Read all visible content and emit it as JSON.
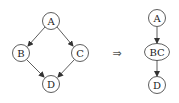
{
  "left_graph": {
    "nodes": [
      {
        "id": "A",
        "label": "A",
        "cx": 51,
        "cy": 21
      },
      {
        "id": "B",
        "label": "B",
        "cx": 21,
        "cy": 53
      },
      {
        "id": "C",
        "label": "C",
        "cx": 80,
        "cy": 53
      },
      {
        "id": "D",
        "label": "D",
        "cx": 51,
        "cy": 84
      }
    ],
    "edges": [
      {
        "from": "A",
        "to": "B"
      },
      {
        "from": "A",
        "to": "C"
      },
      {
        "from": "B",
        "to": "D"
      },
      {
        "from": "C",
        "to": "D"
      }
    ]
  },
  "transform_arrow": "⇒",
  "right_graph": {
    "nodes": [
      {
        "id": "A",
        "label": "A",
        "cx": 157,
        "cy": 18
      },
      {
        "id": "BC",
        "label": "BC",
        "cx": 157,
        "cy": 52
      },
      {
        "id": "D",
        "label": "D",
        "cx": 157,
        "cy": 85
      }
    ],
    "edges": [
      {
        "from": "A",
        "to": "BC"
      },
      {
        "from": "BC",
        "to": "D"
      }
    ]
  },
  "colors": {
    "stroke": "#333333",
    "background": "#ffffff"
  }
}
